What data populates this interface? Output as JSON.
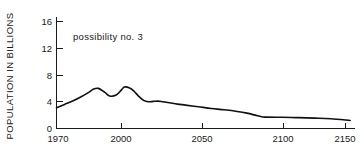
{
  "chart_data": {
    "type": "line",
    "title": "",
    "annotation": "possibility no. 3",
    "xlabel": "",
    "ylabel": "POPULATION IN BILLIONS",
    "xlim": [
      1970,
      2155
    ],
    "ylim": [
      0,
      16
    ],
    "grid": false,
    "legend": false,
    "line_color": "#111111",
    "background_color": "#ffffff",
    "axis_color": "#1a1a1a",
    "xticks": [
      1970,
      2000,
      2050,
      2100,
      2150
    ],
    "xticklabels": [
      "1970",
      "2000",
      "2050",
      "2100",
      "2150"
    ],
    "yticks": [
      0,
      4,
      8,
      12,
      16
    ],
    "yticklabels": [
      "0",
      "4",
      "8",
      "12",
      "16"
    ],
    "series": [
      {
        "name": "possibility no. 3",
        "x": [
          1970,
          1975,
          1980,
          1985,
          1990,
          1993,
          1996,
          2000,
          2003,
          2007,
          2010,
          2012,
          2015,
          2018,
          2021,
          2024,
          2027,
          2030,
          2033,
          2036,
          2040,
          2045,
          2050,
          2058,
          2066,
          2074,
          2082,
          2088,
          2093,
          2097,
          2100,
          2110,
          2120,
          2130,
          2140,
          2152
        ],
        "y": [
          3.1,
          3.6,
          4.1,
          4.7,
          5.4,
          5.9,
          6.0,
          5.4,
          4.85,
          5.0,
          5.7,
          6.2,
          6.1,
          5.6,
          4.8,
          4.2,
          4.0,
          4.05,
          4.1,
          4.0,
          3.85,
          3.65,
          3.5,
          3.25,
          3.0,
          2.8,
          2.55,
          2.3,
          2.0,
          1.75,
          1.7,
          1.68,
          1.62,
          1.55,
          1.45,
          1.2
        ]
      }
    ]
  },
  "ytick_labels": {
    "t0": "0",
    "t1": "4",
    "t2": "8",
    "t3": "12",
    "t4": "16"
  },
  "xtick_labels": {
    "t0": "1970",
    "t1": "2000",
    "t2": "2050",
    "t3": "2100",
    "t4": "2150"
  },
  "labels": {
    "y_axis_title": "POPULATION IN BILLIONS",
    "annotation": "possibility no. 3"
  }
}
